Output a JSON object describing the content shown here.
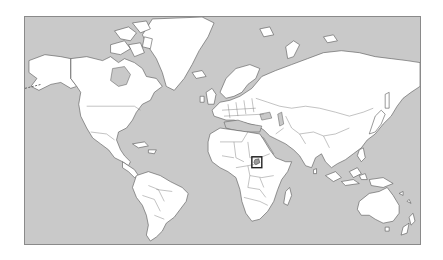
{
  "map": {
    "projection": "Mercator",
    "type": "world-political-outline",
    "colors": {
      "ocean": "#c9c9c9",
      "land": "#ffffff",
      "coastline": "#555555",
      "frame": "#8a8a8a",
      "highlight_box": "#222222",
      "highlight_fill": "#9a9a9a"
    },
    "highlight": {
      "region": "East Africa (Great Lakes)",
      "box": {
        "x": 252,
        "y": 157,
        "width": 10,
        "height": 11
      }
    }
  }
}
